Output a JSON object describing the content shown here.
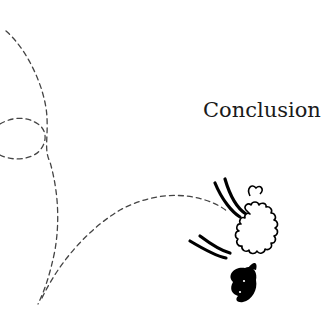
{
  "heading": {
    "text": "Conclusion"
  },
  "illustration": {
    "subject": "sheep-jumping",
    "path_style": "dashed",
    "path_color": "#444444",
    "ink_color": "#000000"
  }
}
